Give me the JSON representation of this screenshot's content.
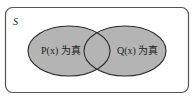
{
  "diagram": {
    "type": "venn",
    "universe_label": "S",
    "sets": [
      {
        "id": "P",
        "label": "P(x) 为真",
        "fill": "#b4b4b4"
      },
      {
        "id": "Q",
        "label": "Q(x) 为真",
        "fill": "#b4b4b4"
      }
    ],
    "stroke": "#2a2a2a",
    "frame_stroke": "#555555"
  }
}
